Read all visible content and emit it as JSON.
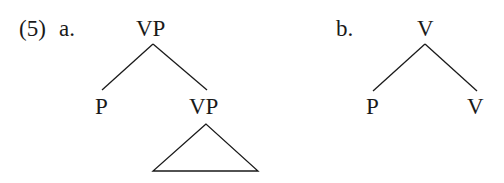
{
  "example": {
    "number": "(5)"
  },
  "trees": [
    {
      "label": "a.",
      "root": "VP",
      "children": [
        {
          "label": "P"
        },
        {
          "label": "VP",
          "subtree": "triangle"
        }
      ]
    },
    {
      "label": "b.",
      "root": "V",
      "children": [
        {
          "label": "P"
        },
        {
          "label": "V"
        }
      ]
    }
  ],
  "colors": {
    "ink": "#1a1a1a",
    "background": "#ffffff"
  }
}
